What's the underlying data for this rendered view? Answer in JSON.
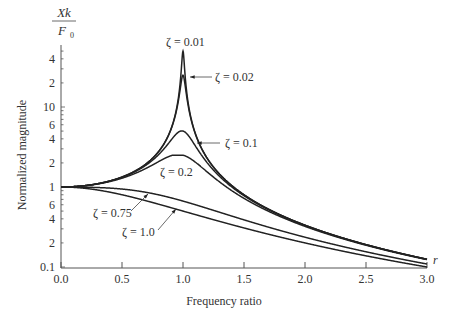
{
  "chart_data": {
    "type": "line",
    "title": "",
    "xlabel": "Frequency ratio",
    "xvar": "r",
    "ylabel": "Normalized magnitude",
    "ylabel_top": {
      "numerator": "Xk",
      "denominator": "F",
      "denominator_sub": "0"
    },
    "yscale": "log",
    "xlim": [
      0.0,
      3.0
    ],
    "ylim": [
      0.1,
      50
    ],
    "grid": false,
    "x_ticks": [
      "0.0",
      "0.5",
      "1.0",
      "1.5",
      "2.0",
      "2.5",
      "3.0"
    ],
    "y_tick_labels": [
      {
        "label": "4",
        "value": 40
      },
      {
        "label": "2",
        "value": 20
      },
      {
        "label": "10",
        "value": 10
      },
      {
        "label": "6",
        "value": 6
      },
      {
        "label": "4",
        "value": 4
      },
      {
        "label": "2",
        "value": 2
      },
      {
        "label": "1",
        "value": 1
      },
      {
        "label": "6",
        "value": 0.6
      },
      {
        "label": "4",
        "value": 0.4
      },
      {
        "label": "2",
        "value": 0.2
      },
      {
        "label": "0.1",
        "value": 0.1
      }
    ],
    "series": [
      {
        "name": "ζ = 0.01",
        "zeta": 0.01,
        "peak": 50
      },
      {
        "name": "ζ = 0.02",
        "zeta": 0.02,
        "peak": 25
      },
      {
        "name": "ζ = 0.1",
        "zeta": 0.1,
        "peak": 5.0
      },
      {
        "name": "ζ = 0.2",
        "zeta": 0.2,
        "peak": 2.5
      },
      {
        "name": "ζ = 0.75",
        "zeta": 0.75,
        "peak": 1.0
      },
      {
        "name": "ζ = 1.0",
        "zeta": 1.0,
        "peak": 1.0
      }
    ],
    "formula": "1/sqrt((1-r^2)^2+(2*zeta*r)^2)",
    "annotations": [
      {
        "text": "ζ = 0.01",
        "position": "above peak"
      },
      {
        "text": "ζ = 0.02",
        "position": "arrow to peak at r≈1.0"
      },
      {
        "text": "ζ = 0.1",
        "position": "arrow to curve near r≈1.05"
      },
      {
        "text": "ζ = 0.2",
        "position": "below curve near r≈1.0"
      },
      {
        "text": "ζ = 0.75",
        "position": "arrow to curve near r≈0.75"
      },
      {
        "text": "ζ = 1.0",
        "position": "arrow to curve near r≈0.95"
      }
    ]
  }
}
